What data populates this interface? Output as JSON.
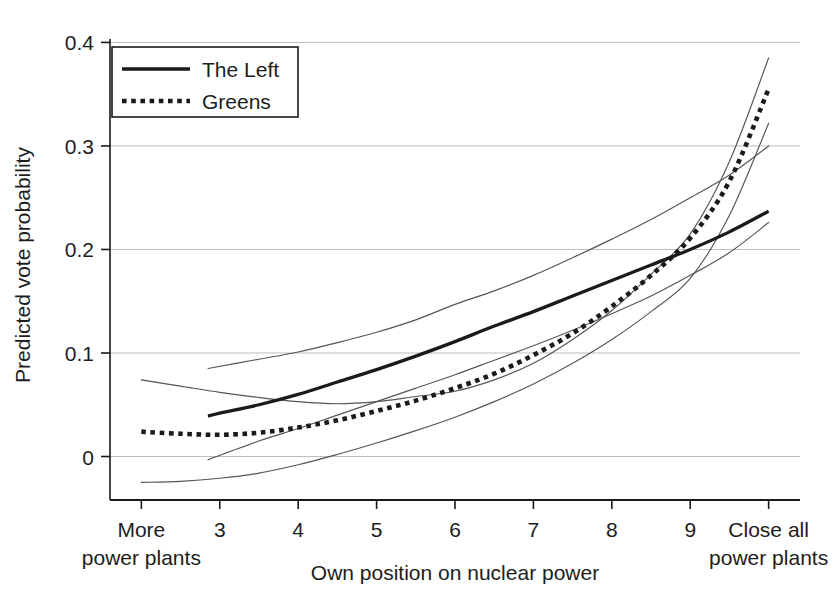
{
  "chart_data": {
    "type": "line",
    "title": "",
    "xlabel": "Own position on nuclear power",
    "ylabel": "Predicted vote probability",
    "xlim": [
      1.6,
      10.4
    ],
    "ylim": [
      -0.042,
      0.412
    ],
    "grid": "horizontal",
    "yticks": [
      "0",
      "0.1",
      "0.2",
      "0.3",
      "0.4"
    ],
    "ytick_values": [
      0,
      0.1,
      0.2,
      0.3,
      0.4
    ],
    "xticks": [
      "More\npower plants",
      "3",
      "4",
      "5",
      "6",
      "7",
      "8",
      "9",
      "Close all\npower plants"
    ],
    "xtick_values": [
      2,
      3,
      4,
      5,
      6,
      7,
      8,
      9,
      10
    ],
    "xtick_labels_line1": [
      "More",
      "3",
      "4",
      "5",
      "6",
      "7",
      "8",
      "9",
      "Close all"
    ],
    "xtick_labels_line2": [
      "power plants",
      "",
      "",
      "",
      "",
      "",
      "",
      "",
      "power plants"
    ],
    "legend": {
      "position": "top-left-inside",
      "entries": [
        {
          "name": "The Left",
          "style": "solid",
          "color": "#1a1a1a"
        },
        {
          "name": "Greens",
          "style": "dotted",
          "color": "#1a1a1a"
        }
      ]
    },
    "series": [
      {
        "name": "The Left",
        "style": "solid",
        "x": [
          2.85,
          3.0,
          3.5,
          4.0,
          4.5,
          5.0,
          5.5,
          6.0,
          6.5,
          7.0,
          7.5,
          8.0,
          8.5,
          9.0,
          9.5,
          10.0
        ],
        "y": [
          0.039,
          0.042,
          0.05,
          0.06,
          0.072,
          0.084,
          0.097,
          0.111,
          0.126,
          0.14,
          0.155,
          0.17,
          0.185,
          0.2,
          0.217,
          0.237
        ]
      },
      {
        "name": "Greens",
        "style": "dotted",
        "x": [
          2.0,
          2.5,
          3.0,
          3.5,
          4.0,
          4.5,
          5.0,
          5.5,
          6.0,
          6.5,
          7.0,
          7.5,
          8.0,
          8.5,
          9.0,
          9.5,
          10.0
        ],
        "y": [
          0.024,
          0.022,
          0.021,
          0.023,
          0.028,
          0.035,
          0.044,
          0.054,
          0.066,
          0.08,
          0.098,
          0.119,
          0.145,
          0.175,
          0.211,
          0.266,
          0.355
        ]
      },
      {
        "name": "The Left upper CI",
        "style": "thin",
        "x": [
          2.85,
          3.5,
          4.0,
          4.5,
          5.0,
          5.5,
          6.0,
          6.5,
          7.0,
          7.5,
          8.0,
          8.5,
          9.0,
          9.5,
          10.0
        ],
        "y": [
          0.085,
          0.094,
          0.101,
          0.11,
          0.12,
          0.132,
          0.147,
          0.16,
          0.175,
          0.192,
          0.21,
          0.229,
          0.25,
          0.272,
          0.3
        ]
      },
      {
        "name": "The Left lower CI",
        "style": "thin",
        "x": [
          2.85,
          3.5,
          4.0,
          4.5,
          5.0,
          5.5,
          6.0,
          6.5,
          7.0,
          7.5,
          8.0,
          8.5,
          9.0,
          9.5,
          10.0
        ],
        "y": [
          -0.003,
          0.015,
          0.027,
          0.04,
          0.053,
          0.066,
          0.079,
          0.093,
          0.107,
          0.122,
          0.138,
          0.155,
          0.175,
          0.197,
          0.226
        ]
      },
      {
        "name": "Greens upper CI",
        "style": "thin",
        "x": [
          2.0,
          2.5,
          3.0,
          3.5,
          4.0,
          4.5,
          5.0,
          5.5,
          6.0,
          6.5,
          7.0,
          7.5,
          8.0,
          8.5,
          9.0,
          9.5,
          10.0
        ],
        "y": [
          0.074,
          0.068,
          0.062,
          0.057,
          0.053,
          0.051,
          0.053,
          0.058,
          0.063,
          0.074,
          0.09,
          0.113,
          0.141,
          0.176,
          0.215,
          0.285,
          0.385
        ]
      },
      {
        "name": "Greens lower CI",
        "style": "thin",
        "x": [
          2.0,
          2.5,
          3.0,
          3.5,
          4.0,
          4.5,
          5.0,
          5.5,
          6.0,
          6.5,
          7.0,
          7.5,
          8.0,
          8.5,
          9.0,
          9.5,
          10.0
        ],
        "y": [
          -0.025,
          -0.024,
          -0.021,
          -0.016,
          -0.008,
          0.002,
          0.013,
          0.025,
          0.038,
          0.053,
          0.07,
          0.09,
          0.113,
          0.14,
          0.172,
          0.233,
          0.322
        ]
      }
    ]
  },
  "colors": {
    "axis": "#1a1a1a",
    "grid": "#bdbdbd",
    "main_line": "#1a1a1a",
    "ci_line": "#555555",
    "background": "#ffffff"
  }
}
